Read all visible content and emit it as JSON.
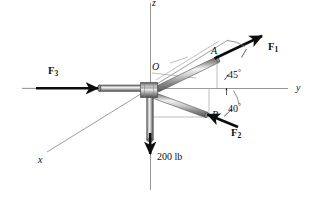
{
  "figure": {
    "background": "#ffffff",
    "ink": "#111111",
    "axis_color": "#7a7a7a",
    "rod_light": "#e8e8e8",
    "rod_mid": "#b4b4b4",
    "rod_dark": "#6e6e6e",
    "rod_edge": "#4a4a4a",
    "construction_color": "#9a9a9a"
  },
  "axes": [
    {
      "id": "x-axis",
      "label": "x",
      "label_x": 38,
      "label_y": 155,
      "italic": true
    },
    {
      "id": "y-axis",
      "label": "y",
      "label_x": 296,
      "label_y": 83,
      "italic": true
    },
    {
      "id": "z-axis",
      "label": "z",
      "label_x": 152,
      "label_y": -2,
      "italic": true
    }
  ],
  "points": [
    {
      "id": "point-o",
      "label": "O",
      "label_x": 152,
      "label_y": 62,
      "italic": true
    },
    {
      "id": "point-a",
      "label": "A",
      "label_x": 211,
      "label_y": 46,
      "italic": true
    },
    {
      "id": "point-b",
      "label": "B",
      "label_x": 212,
      "label_y": 110,
      "italic": true
    }
  ],
  "forces": [
    {
      "id": "force-f1",
      "symbol": "F",
      "subscript": "1",
      "label_x": 268,
      "label_y": 42
    },
    {
      "id": "force-f2",
      "symbol": "F",
      "subscript": "2",
      "label_x": 231,
      "label_y": 128
    },
    {
      "id": "force-f3",
      "symbol": "F",
      "subscript": "3",
      "label_x": 48,
      "label_y": 66
    }
  ],
  "load": {
    "id": "load-200lb",
    "label": "200 lb",
    "value": 200,
    "unit": "lb",
    "label_x": 157,
    "label_y": 152
  },
  "angles": [
    {
      "id": "angle-45",
      "label": "45",
      "degree_symbol": "°",
      "label_x": 228,
      "label_y": 69
    },
    {
      "id": "angle-40",
      "label": "40",
      "degree_symbol": "°",
      "label_x": 228,
      "label_y": 103
    }
  ]
}
